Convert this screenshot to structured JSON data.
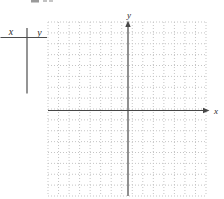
{
  "figure": {
    "value_table": {
      "header_x": "x",
      "header_y": "y"
    },
    "graph": {
      "x_axis_label": "x",
      "y_axis_label": "y"
    },
    "colors": {
      "background": "#ffffff",
      "grid_line": "#c5c5c5",
      "axis_line": "#474747",
      "table_line": "#4d4d4d",
      "label_text": "#2b2b2b",
      "artifact": "#9a9a9a"
    }
  },
  "chart_data": {
    "type": "scatter",
    "title": "",
    "xlabel": "x",
    "ylabel": "y",
    "grid": "dotted",
    "grid_columns": 15,
    "grid_rows": 16,
    "series": [],
    "legend": "none",
    "annotations": [
      "blank x-y value table with headers x and y at top left",
      "empty coordinate plane, no points plotted",
      "axes unlabeled except variable names, no tick numbers"
    ]
  }
}
